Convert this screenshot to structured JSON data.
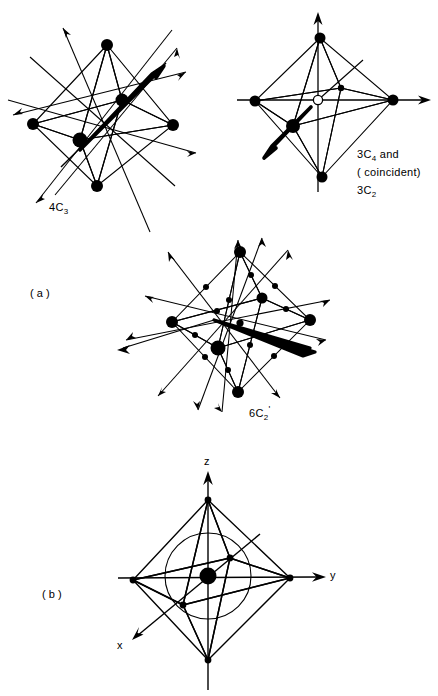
{
  "figure": {
    "type": "diagram",
    "panels": [
      {
        "id": "a",
        "label": "( a )"
      },
      {
        "id": "b",
        "label": "( b )"
      }
    ],
    "diagrams": [
      {
        "id": "4C3",
        "caption": "4C",
        "caption_sub": "3",
        "description": "Octahedron with four C3 axes through opposite triangular faces",
        "axis_count": 4,
        "center_marker": "none"
      },
      {
        "id": "3C4-3C2",
        "caption_lines": [
          "3C4 and",
          "( coincident)",
          "3C2"
        ],
        "line1_main": "3C",
        "line1_sub": "4",
        "line1_tail": " and",
        "line2": "( coincident)",
        "line3_main": "3C",
        "line3_sub": "2",
        "description": "Octahedron with three C4 axes through opposite vertices, coincident with three C2 axes",
        "axis_count": 3,
        "center_marker": "open-circle"
      },
      {
        "id": "6C2prime",
        "caption": "6C",
        "caption_sub": "2",
        "caption_prime": "'",
        "description": "Octahedron with six C2 prime axes through midpoints of opposite edges",
        "axis_count": 6,
        "center_marker": "small-filled"
      },
      {
        "id": "axes-sphere",
        "description": "Octahedron with cartesian axes and inscribed sphere",
        "axis_labels": [
          "z",
          "y",
          "x"
        ],
        "center_marker": "large-filled",
        "sphere": true
      }
    ],
    "axis_labels": {
      "z": "z",
      "y": "y",
      "x": "x"
    },
    "colors": {
      "ink": "#000000",
      "paper": "#ffffff"
    }
  }
}
